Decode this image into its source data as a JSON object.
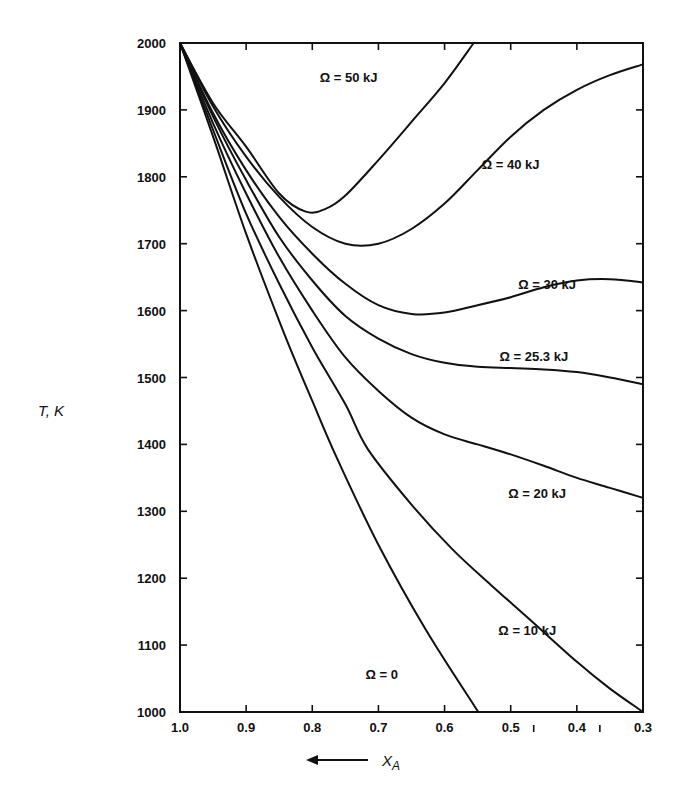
{
  "chart_data": {
    "type": "line",
    "title": "",
    "xlabel": "X_A",
    "xlabel_arrow": "←",
    "ylabel": "T, K",
    "xlim": [
      1.0,
      0.3
    ],
    "ylim": [
      1000,
      2000
    ],
    "x_reversed": true,
    "grid": false,
    "legend": "inline labels",
    "x_ticks": [
      1.0,
      0.9,
      0.8,
      0.7,
      0.6,
      0.5,
      0.4,
      0.3
    ],
    "x_tick_labels": [
      "1.0",
      "0.9",
      "0.8",
      "0.7",
      "0.6",
      "0.5",
      "0.4",
      "0.3"
    ],
    "y_ticks": [
      1000,
      1100,
      1200,
      1300,
      1400,
      1500,
      1600,
      1700,
      1800,
      1900,
      2000
    ],
    "y_tick_labels": [
      "1000",
      "1100",
      "1200",
      "1300",
      "1400",
      "1500",
      "1600",
      "1700",
      "1800",
      "1900",
      "2000"
    ],
    "series": [
      {
        "name": "Ω = 0",
        "label_pos": [
          0.695,
          1050
        ],
        "points": [
          [
            1.0,
            2000
          ],
          [
            0.95,
            1860
          ],
          [
            0.9,
            1715
          ],
          [
            0.845,
            1572
          ],
          [
            0.8,
            1465
          ],
          [
            0.762,
            1378
          ],
          [
            0.7,
            1250
          ],
          [
            0.629,
            1124
          ],
          [
            0.549,
            1000
          ]
        ]
      },
      {
        "name": "Ω = 10 kJ",
        "label_pos": [
          0.475,
          1115
        ],
        "points": [
          [
            1.0,
            2000
          ],
          [
            0.95,
            1870
          ],
          [
            0.9,
            1745
          ],
          [
            0.85,
            1640
          ],
          [
            0.8,
            1545
          ],
          [
            0.75,
            1460
          ],
          [
            0.716,
            1393
          ],
          [
            0.65,
            1310
          ],
          [
            0.588,
            1243
          ],
          [
            0.53,
            1190
          ],
          [
            0.472,
            1139
          ],
          [
            0.4,
            1075
          ],
          [
            0.35,
            1035
          ],
          [
            0.3,
            1000
          ]
        ]
      },
      {
        "name": "Ω = 20 kJ",
        "label_pos": [
          0.46,
          1320
        ],
        "points": [
          [
            1.0,
            2000
          ],
          [
            0.95,
            1880
          ],
          [
            0.9,
            1775
          ],
          [
            0.85,
            1680
          ],
          [
            0.8,
            1600
          ],
          [
            0.75,
            1530
          ],
          [
            0.7,
            1480
          ],
          [
            0.65,
            1440
          ],
          [
            0.6,
            1415
          ],
          [
            0.55,
            1400
          ],
          [
            0.5,
            1385
          ],
          [
            0.45,
            1368
          ],
          [
            0.4,
            1350
          ],
          [
            0.35,
            1335
          ],
          [
            0.3,
            1320
          ]
        ]
      },
      {
        "name": "Ω = 25.3 kJ",
        "label_pos": [
          0.465,
          1525
        ],
        "points": [
          [
            1.0,
            2000
          ],
          [
            0.95,
            1890
          ],
          [
            0.9,
            1795
          ],
          [
            0.85,
            1710
          ],
          [
            0.8,
            1645
          ],
          [
            0.75,
            1592
          ],
          [
            0.7,
            1558
          ],
          [
            0.65,
            1535
          ],
          [
            0.6,
            1522
          ],
          [
            0.55,
            1516
          ],
          [
            0.5,
            1514
          ],
          [
            0.45,
            1512
          ],
          [
            0.4,
            1508
          ],
          [
            0.35,
            1500
          ],
          [
            0.3,
            1490
          ]
        ]
      },
      {
        "name": "Ω = 30 kJ",
        "label_pos": [
          0.445,
          1632
        ],
        "points": [
          [
            1.0,
            2000
          ],
          [
            0.95,
            1895
          ],
          [
            0.9,
            1810
          ],
          [
            0.85,
            1740
          ],
          [
            0.8,
            1685
          ],
          [
            0.75,
            1640
          ],
          [
            0.7,
            1608
          ],
          [
            0.65,
            1595
          ],
          [
            0.6,
            1597
          ],
          [
            0.55,
            1608
          ],
          [
            0.5,
            1620
          ],
          [
            0.45,
            1635
          ],
          [
            0.4,
            1645
          ],
          [
            0.35,
            1647
          ],
          [
            0.3,
            1642
          ]
        ]
      },
      {
        "name": "Ω = 40 kJ",
        "label_pos": [
          0.5,
          1812
        ],
        "points": [
          [
            1.0,
            2000
          ],
          [
            0.95,
            1905
          ],
          [
            0.9,
            1830
          ],
          [
            0.85,
            1770
          ],
          [
            0.8,
            1725
          ],
          [
            0.75,
            1700
          ],
          [
            0.7,
            1700
          ],
          [
            0.65,
            1722
          ],
          [
            0.6,
            1760
          ],
          [
            0.55,
            1810
          ],
          [
            0.5,
            1860
          ],
          [
            0.45,
            1900
          ],
          [
            0.4,
            1930
          ],
          [
            0.35,
            1952
          ],
          [
            0.3,
            1968
          ]
        ]
      },
      {
        "name": "Ω = 50 kJ",
        "label_pos": [
          0.745,
          1942
        ],
        "points": [
          [
            1.0,
            2000
          ],
          [
            0.95,
            1910
          ],
          [
            0.9,
            1845
          ],
          [
            0.85,
            1775
          ],
          [
            0.81,
            1748
          ],
          [
            0.78,
            1752
          ],
          [
            0.75,
            1772
          ],
          [
            0.7,
            1825
          ],
          [
            0.65,
            1882
          ],
          [
            0.6,
            1940
          ],
          [
            0.556,
            2000
          ]
        ]
      }
    ]
  }
}
